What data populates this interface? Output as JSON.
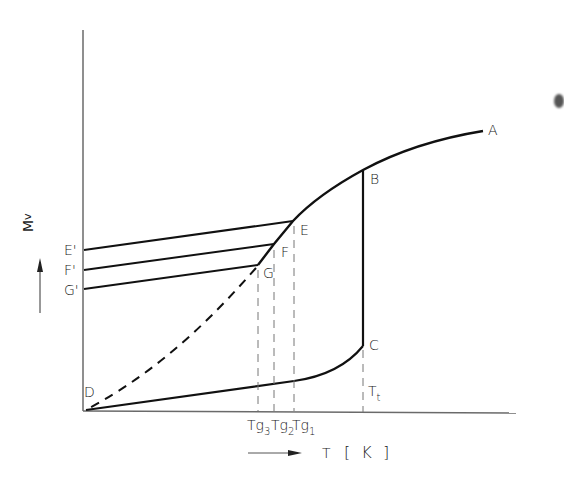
{
  "figure": {
    "type": "phase-transition / glass-transition schematic",
    "axes": {
      "x_label": "T [K]",
      "y_label": "M_v",
      "y_label_main": "M",
      "y_label_sub": "v",
      "x_arrow": "→",
      "y_arrow": "↑"
    },
    "points": {
      "A": "A",
      "B": "B",
      "C": "C",
      "D": "D",
      "E": "E",
      "F": "F",
      "G": "G",
      "E_prime": "E'",
      "F_prime": "F'",
      "G_prime": "G'"
    },
    "ticks": {
      "tg3_main": "T",
      "tg3_g": "g",
      "tg3_sub": "3",
      "tg2_main": "T",
      "tg2_g": "g",
      "tg2_sub": "2",
      "tg1_main": "T",
      "tg1_g": "g",
      "tg1_sub": "1",
      "tt_main": "T",
      "tt_sub": "t"
    },
    "x_label_T": "T",
    "x_label_unit": "[ K ]",
    "curves": [
      {
        "name": "liquid curve A–B–E–F–G",
        "style": "solid"
      },
      {
        "name": "extrapolated supercooled liquid G–D",
        "style": "dashed"
      },
      {
        "name": "crystal curve D–C",
        "style": "solid"
      },
      {
        "name": "melting/transition jump B–C at Tt",
        "style": "solid vertical"
      },
      {
        "name": "glass lines E–E', F–F', G–G'",
        "style": "solid"
      },
      {
        "name": "reference lines at Tg3, Tg2, Tg1, Tt",
        "style": "dashed vertical"
      }
    ],
    "colors": {
      "ink": "#1a1a1a",
      "background": "#ffffff"
    }
  }
}
